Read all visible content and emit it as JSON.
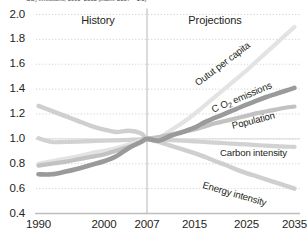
{
  "figure": {
    "suptitle": "CO₂ emissions, 1990–2035 (index: 2007 = 1.0)",
    "zone_left_label": "History",
    "zone_right_label": "Projections",
    "divider_year": 2007
  },
  "axes": {
    "y_ticks": [
      "2.0",
      "1.8",
      "1.6",
      "1.4",
      "1.2",
      "1.0",
      "0.8",
      "0.6",
      "0.4"
    ],
    "x_ticks": [
      "1990",
      "2000",
      "2007",
      "2015",
      "2025",
      "2035"
    ]
  },
  "colors": {
    "output_per_capita": "#e3e3e3",
    "co2_emissions": "#9a9a9a",
    "population": "#c2c2c2",
    "carbon_intensity": "#d2d2d2",
    "energy_intensity": "#cfcfcf",
    "gridline": "#c9c9c9",
    "axisline": "#bdbdbd",
    "divider": "#bdbdbd",
    "text": "#231f20"
  },
  "chart_data": {
    "type": "line",
    "title": "CO₂ emissions, 1990–2035 (index: 2007 = 1.0)",
    "xlabel": "",
    "ylabel": "",
    "xlim": [
      1990,
      2035
    ],
    "ylim": [
      0.4,
      2.0
    ],
    "grid": true,
    "legend": "inline-annotations",
    "index_year": 2007,
    "index_value": 1.0,
    "x_tick_values": [
      1990,
      2000,
      2007,
      2015,
      2025,
      2035
    ],
    "y_tick_values": [
      0.4,
      0.6,
      0.8,
      1.0,
      1.2,
      1.4,
      1.6,
      1.8,
      2.0
    ],
    "annotations": [
      {
        "text": "History",
        "x": 1997,
        "y": 1.93
      },
      {
        "text": "Projections",
        "x": 2022,
        "y": 1.93
      }
    ],
    "series": [
      {
        "name": "Outut per capita",
        "label": "Outut per capita",
        "color": "#e3e3e3",
        "width": 4.2,
        "x": [
          1990,
          1992,
          1994,
          1996,
          1998,
          2000,
          2002,
          2004,
          2006,
          2007,
          2009,
          2011,
          2013,
          2015,
          2017,
          2019,
          2021,
          2023,
          2025,
          2027,
          2029,
          2031,
          2033,
          2035
        ],
        "y": [
          0.8,
          0.82,
          0.84,
          0.86,
          0.885,
          0.905,
          0.925,
          0.955,
          0.985,
          1.0,
          1.01,
          1.07,
          1.13,
          1.2,
          1.27,
          1.34,
          1.41,
          1.48,
          1.55,
          1.62,
          1.69,
          1.76,
          1.83,
          1.9
        ]
      },
      {
        "name": "C O2 emissions",
        "label": "C O₂ emissions",
        "color": "#9a9a9a",
        "width": 4.6,
        "x": [
          1990,
          1992,
          1994,
          1996,
          1998,
          2000,
          2002,
          2004,
          2006,
          2007,
          2009,
          2011,
          2013,
          2015,
          2017,
          2019,
          2021,
          2023,
          2025,
          2027,
          2029,
          2031,
          2033,
          2035
        ],
        "y": [
          0.715,
          0.715,
          0.735,
          0.76,
          0.79,
          0.82,
          0.86,
          0.925,
          0.975,
          1.0,
          0.985,
          1.025,
          1.055,
          1.09,
          1.135,
          1.17,
          1.205,
          1.24,
          1.275,
          1.305,
          1.335,
          1.36,
          1.385,
          1.41
        ]
      },
      {
        "name": "Population",
        "label": "Population",
        "color": "#c2c2c2",
        "width": 4.2,
        "x": [
          1990,
          1992,
          1994,
          1996,
          1998,
          2000,
          2002,
          2004,
          2006,
          2007,
          2009,
          2011,
          2013,
          2015,
          2017,
          2019,
          2021,
          2023,
          2025,
          2027,
          2029,
          2031,
          2033,
          2035
        ],
        "y": [
          0.785,
          0.8,
          0.815,
          0.835,
          0.855,
          0.875,
          0.905,
          0.935,
          0.975,
          1.0,
          1.015,
          1.035,
          1.055,
          1.075,
          1.1,
          1.125,
          1.145,
          1.165,
          1.185,
          1.205,
          1.22,
          1.235,
          1.25,
          1.26
        ]
      },
      {
        "name": "Carbon intensity",
        "label": "Carbon intensity",
        "color": "#d2d2d2",
        "width": 4.2,
        "x": [
          1990,
          1992,
          1994,
          1996,
          1998,
          2000,
          2002,
          2004,
          2006,
          2007,
          2009,
          2011,
          2013,
          2015,
          2017,
          2019,
          2021,
          2023,
          2025,
          2027,
          2029,
          2031,
          2033,
          2035
        ],
        "y": [
          1.005,
          0.975,
          0.975,
          0.978,
          0.982,
          0.985,
          0.988,
          0.992,
          0.997,
          1.0,
          0.995,
          0.99,
          0.985,
          0.98,
          0.975,
          0.97,
          0.965,
          0.96,
          0.955,
          0.95,
          0.946,
          0.942,
          0.938,
          0.935
        ]
      },
      {
        "name": "Energy intensity",
        "label": "Energy intensity",
        "color": "#cfcfcf",
        "width": 4.4,
        "x": [
          1990,
          1992,
          1994,
          1996,
          1998,
          2000,
          2002,
          2004,
          2006,
          2007,
          2009,
          2011,
          2013,
          2015,
          2017,
          2019,
          2021,
          2023,
          2025,
          2027,
          2029,
          2031,
          2033,
          2035
        ],
        "y": [
          1.265,
          1.225,
          1.185,
          1.145,
          1.105,
          1.075,
          1.055,
          1.065,
          1.045,
          1.0,
          0.975,
          0.945,
          0.915,
          0.885,
          0.855,
          0.82,
          0.79,
          0.755,
          0.725,
          0.7,
          0.675,
          0.65,
          0.625,
          0.6
        ]
      }
    ]
  },
  "series_labels": [
    {
      "id": "output-per-capita",
      "text": "Outut per capita",
      "x": 196,
      "y": 78,
      "rot": -37
    },
    {
      "id": "co2-emissions",
      "text": "C O",
      "sub": "2",
      "text2": " emissions",
      "x": 212,
      "y": 104,
      "rot": -23
    },
    {
      "id": "population",
      "text": "Population",
      "x": 232,
      "y": 120,
      "rot": -14
    },
    {
      "id": "carbon-intensity",
      "text": "Carbon intensity",
      "x": 220,
      "y": 147,
      "rot": 0
    },
    {
      "id": "energy-intensity",
      "text": "Energy intensity",
      "x": 203,
      "y": 179,
      "rot": 16
    }
  ]
}
